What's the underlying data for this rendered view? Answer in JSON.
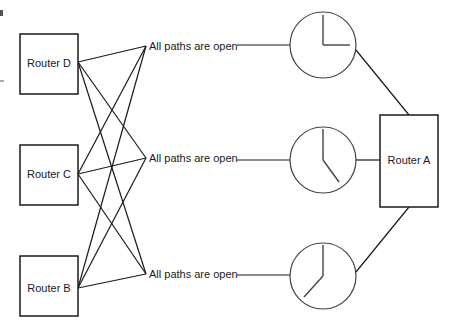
{
  "diagram": {
    "routers": {
      "d": {
        "label": "Router D"
      },
      "c": {
        "label": "Router C"
      },
      "b": {
        "label": "Router B"
      },
      "a": {
        "label": "Router A"
      }
    },
    "paths": [
      {
        "label": "All paths are open",
        "clock": "3:00"
      },
      {
        "label": "All paths are open",
        "clock": "5:00"
      },
      {
        "label": "All paths are open",
        "clock": "7:00"
      }
    ],
    "colors": {
      "line": "#1a1a1a",
      "clock": "#444444",
      "background": "#ffffff"
    }
  }
}
